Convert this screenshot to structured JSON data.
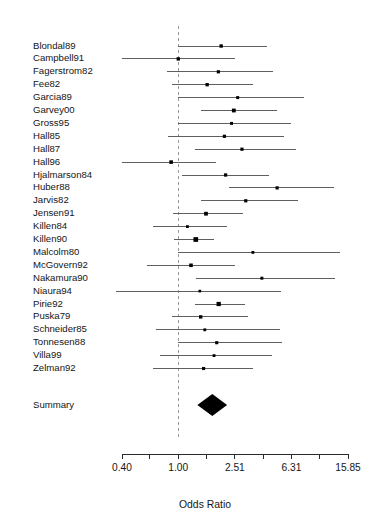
{
  "chart_data": {
    "type": "forest",
    "title": "",
    "xlabel": "Odds Ratio",
    "ylabel": "",
    "scale": "log",
    "xlim": [
      0.4,
      15.85
    ],
    "grid": false,
    "reference_line": 1.0,
    "legend": "none",
    "tick_values": [
      0.4,
      0.63,
      1.0,
      1.58,
      2.51,
      3.98,
      6.31,
      10.0,
      15.85
    ],
    "tick_labels": [
      "0.40",
      "",
      "1.00",
      "",
      "2.51",
      "",
      "6.31",
      "",
      "15.85"
    ],
    "labeled_ticks": [
      "0.40",
      "1.00",
      "2.51",
      "6.31",
      "15.85"
    ],
    "categories": [
      "Blondal89",
      "Campbell91",
      "Fagerstrom82",
      "Fee82",
      "Garcia89",
      "Garvey00",
      "Gross95",
      "Hall85",
      "Hall87",
      "Hall96",
      "Hjalmarson84",
      "Huber88",
      "Jarvis82",
      "Jensen91",
      "Killen84",
      "Killen90",
      "Malcolm80",
      "McGovern92",
      "Nakamura90",
      "Niaura94",
      "Pirie92",
      "Puska79",
      "Schneider85",
      "Tonnesen88",
      "Villa99",
      "Zelman92"
    ],
    "studies": [
      {
        "name": "Blondal89",
        "or": 2.01,
        "lower": 1.0,
        "upper": 4.21,
        "weight": 2.6
      },
      {
        "name": "Campbell91",
        "or": 1.0,
        "lower": 0.4,
        "upper": 2.5,
        "weight": 2.6
      },
      {
        "name": "Fagerstrom82",
        "or": 1.92,
        "lower": 0.83,
        "upper": 4.68,
        "weight": 2.3
      },
      {
        "name": "Fee82",
        "or": 1.6,
        "lower": 0.9,
        "upper": 3.4,
        "weight": 2.5
      },
      {
        "name": "Garcia89",
        "or": 2.63,
        "lower": 1.0,
        "upper": 7.8,
        "weight": 2.0
      },
      {
        "name": "Garvey00",
        "or": 2.47,
        "lower": 1.45,
        "upper": 4.96,
        "weight": 3.3
      },
      {
        "name": "Gross95",
        "or": 2.38,
        "lower": 1.0,
        "upper": 6.25,
        "weight": 2.0
      },
      {
        "name": "Hall85",
        "or": 2.12,
        "lower": 0.85,
        "upper": 5.6,
        "weight": 2.3
      },
      {
        "name": "Hall87",
        "or": 2.82,
        "lower": 1.32,
        "upper": 6.8,
        "weight": 2.3
      },
      {
        "name": "Hall96",
        "or": 0.89,
        "lower": 0.4,
        "upper": 1.84,
        "weight": 2.9
      },
      {
        "name": "Hjalmarson84",
        "or": 2.16,
        "lower": 1.06,
        "upper": 4.4,
        "weight": 2.4
      },
      {
        "name": "Huber88",
        "or": 5.0,
        "lower": 2.3,
        "upper": 12.7,
        "weight": 2.3
      },
      {
        "name": "Jarvis82",
        "or": 3.0,
        "lower": 1.45,
        "upper": 7.0,
        "weight": 2.3
      },
      {
        "name": "Jensen91",
        "or": 1.57,
        "lower": 0.92,
        "upper": 2.88,
        "weight": 3.2
      },
      {
        "name": "Killen84",
        "or": 1.16,
        "lower": 0.66,
        "upper": 2.2,
        "weight": 1.8
      },
      {
        "name": "Killen90",
        "or": 1.33,
        "lower": 0.93,
        "upper": 1.8,
        "weight": 5.0
      },
      {
        "name": "Malcolm80",
        "or": 3.37,
        "lower": 1.0,
        "upper": 14.0,
        "weight": 1.8
      },
      {
        "name": "McGovern92",
        "or": 1.23,
        "lower": 0.6,
        "upper": 2.5,
        "weight": 2.9
      },
      {
        "name": "Nakamura90",
        "or": 3.9,
        "lower": 1.33,
        "upper": 12.8,
        "weight": 2.0
      },
      {
        "name": "Niaura94",
        "or": 1.42,
        "lower": 0.25,
        "upper": 5.3,
        "weight": 1.6
      },
      {
        "name": "Pirie92",
        "or": 1.93,
        "lower": 1.31,
        "upper": 2.95,
        "weight": 4.1
      },
      {
        "name": "Puska79",
        "or": 1.44,
        "lower": 0.9,
        "upper": 3.1,
        "weight": 2.6
      },
      {
        "name": "Schneider85",
        "or": 1.54,
        "lower": 0.7,
        "upper": 5.2,
        "weight": 1.8
      },
      {
        "name": "Tonnesen88",
        "or": 1.87,
        "lower": 1.0,
        "upper": 5.4,
        "weight": 2.2
      },
      {
        "name": "Villa99",
        "or": 1.79,
        "lower": 0.74,
        "upper": 4.6,
        "weight": 1.8
      },
      {
        "name": "Zelman92",
        "or": 1.51,
        "lower": 0.66,
        "upper": 3.4,
        "weight": 2.2
      }
    ],
    "summary": {
      "label": "Summary",
      "or": 1.74,
      "lower": 1.48,
      "upper": 2.04
    }
  }
}
